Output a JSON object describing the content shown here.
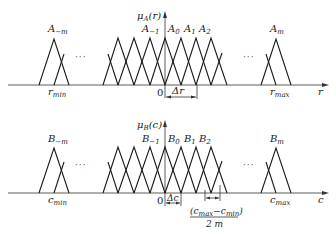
{
  "diagram": {
    "top_plot": {
      "y_axis_label": {
        "mu": "μ",
        "sub": "A",
        "arg": "(r)"
      },
      "x_axis_label": "r",
      "origin_label": "0",
      "min_label": {
        "base": "r",
        "sub": "min"
      },
      "max_label": {
        "base": "r",
        "sub": "max"
      },
      "spacing_label": "Δr",
      "ellipsis_left": "···",
      "ellipsis_right": "···",
      "sets": [
        {
          "base": "A",
          "sub": "−m"
        },
        {
          "base": "A",
          "sub": "−1"
        },
        {
          "base": "A",
          "sub": "0"
        },
        {
          "base": "A",
          "sub": "1"
        },
        {
          "base": "A",
          "sub": "2"
        },
        {
          "base": "A",
          "sub": "m"
        }
      ]
    },
    "bottom_plot": {
      "y_axis_label": {
        "mu": "μ",
        "sub": "B",
        "arg": "(c)"
      },
      "x_axis_label": "c",
      "origin_label": "0",
      "min_label": {
        "base": "c",
        "sub": "min"
      },
      "max_label": {
        "base": "c",
        "sub": "max"
      },
      "spacing_label": "Δc",
      "ellipsis_left": "···",
      "ellipsis_right": "···",
      "sets": [
        {
          "base": "B",
          "sub": "−m"
        },
        {
          "base": "B",
          "sub": "−1"
        },
        {
          "base": "B",
          "sub": "0"
        },
        {
          "base": "B",
          "sub": "1"
        },
        {
          "base": "B",
          "sub": "2"
        },
        {
          "base": "B",
          "sub": "m"
        }
      ],
      "fraction": {
        "numerator": {
          "open": "(c",
          "sub1": "max",
          "minus": "−c",
          "sub2": "min",
          "close": ")"
        },
        "denominator": "2 m"
      }
    }
  }
}
